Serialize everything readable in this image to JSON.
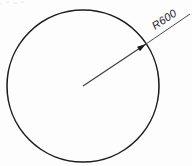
{
  "drawing": {
    "title": "Circle radius dimension",
    "background_color": "#fdfdfd",
    "line_color": "#1d1d1d",
    "text_color": "#222222"
  },
  "circle": {
    "label": "circle-outline",
    "center_x": 83,
    "center_y": 86,
    "radius": 76,
    "stroke_width": 1.55
  },
  "dimension": {
    "text": "R600",
    "value": 600,
    "prefix": "R",
    "type": "radius",
    "rotation_deg": -29,
    "text_x": 155,
    "text_y": 30,
    "underline": true,
    "leader": {
      "from_x": 83,
      "from_y": 86,
      "to_x": 146,
      "to_y": 44,
      "tail_to_x": 190,
      "tail_to_y": 14
    },
    "arrow": {
      "x": 146,
      "y": 44,
      "angle_deg": -33.7
    }
  }
}
